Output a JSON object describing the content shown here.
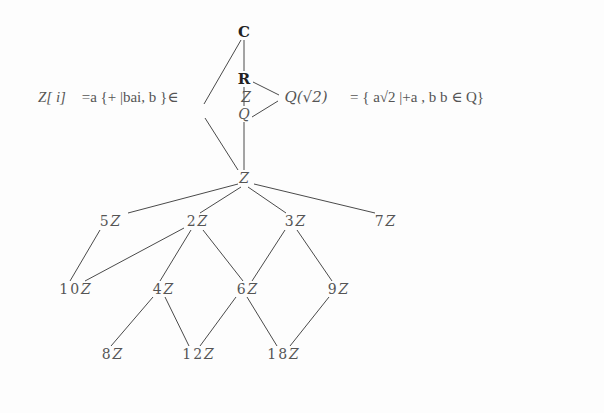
{
  "diagram": {
    "type": "subring-ideal-lattice",
    "line_color": "#4a4a4a",
    "text_color": "#555555",
    "top_nodes": {
      "C": "C",
      "R": "R",
      "Q_sqrt2": "Q(√2)",
      "Q": "Q",
      "Z_inner": "Z",
      "Z": "Z"
    },
    "left_formula": {
      "lhs": "Z[ i]",
      "text": "=a {+ |bai,   b }∈"
    },
    "right_formula": {
      "text": "=   { a√2 |+a , b  b   ∈  Q}"
    },
    "ideals": {
      "level1": [
        {
          "coef": "5",
          "sym": "Z"
        },
        {
          "coef": "2",
          "sym": "Z"
        },
        {
          "coef": "3",
          "sym": "Z"
        },
        {
          "coef": "7",
          "sym": "Z"
        }
      ],
      "level2": [
        {
          "coef": "10",
          "sym": "Z"
        },
        {
          "coef": "4",
          "sym": "Z"
        },
        {
          "coef": "6",
          "sym": "Z"
        },
        {
          "coef": "9",
          "sym": "Z"
        }
      ],
      "level3": [
        {
          "coef": "8",
          "sym": "Z"
        },
        {
          "coef": "12",
          "sym": "Z"
        },
        {
          "coef": "18",
          "sym": "Z"
        }
      ]
    },
    "edges": [
      [
        "C",
        "R"
      ],
      [
        "C",
        "Z[i]"
      ],
      [
        "R",
        "Q(√2)"
      ],
      [
        "R",
        "Q"
      ],
      [
        "Q(√2)",
        "Q"
      ],
      [
        "Z[i]",
        "Z"
      ],
      [
        "Q",
        "Z"
      ],
      [
        "Z",
        "5Z"
      ],
      [
        "Z",
        "2Z"
      ],
      [
        "Z",
        "3Z"
      ],
      [
        "Z",
        "7Z"
      ],
      [
        "5Z",
        "10Z"
      ],
      [
        "2Z",
        "10Z"
      ],
      [
        "2Z",
        "4Z"
      ],
      [
        "2Z",
        "6Z"
      ],
      [
        "3Z",
        "6Z"
      ],
      [
        "3Z",
        "9Z"
      ],
      [
        "4Z",
        "8Z"
      ],
      [
        "4Z",
        "12Z"
      ],
      [
        "6Z",
        "12Z"
      ],
      [
        "6Z",
        "18Z"
      ],
      [
        "9Z",
        "18Z"
      ]
    ]
  }
}
